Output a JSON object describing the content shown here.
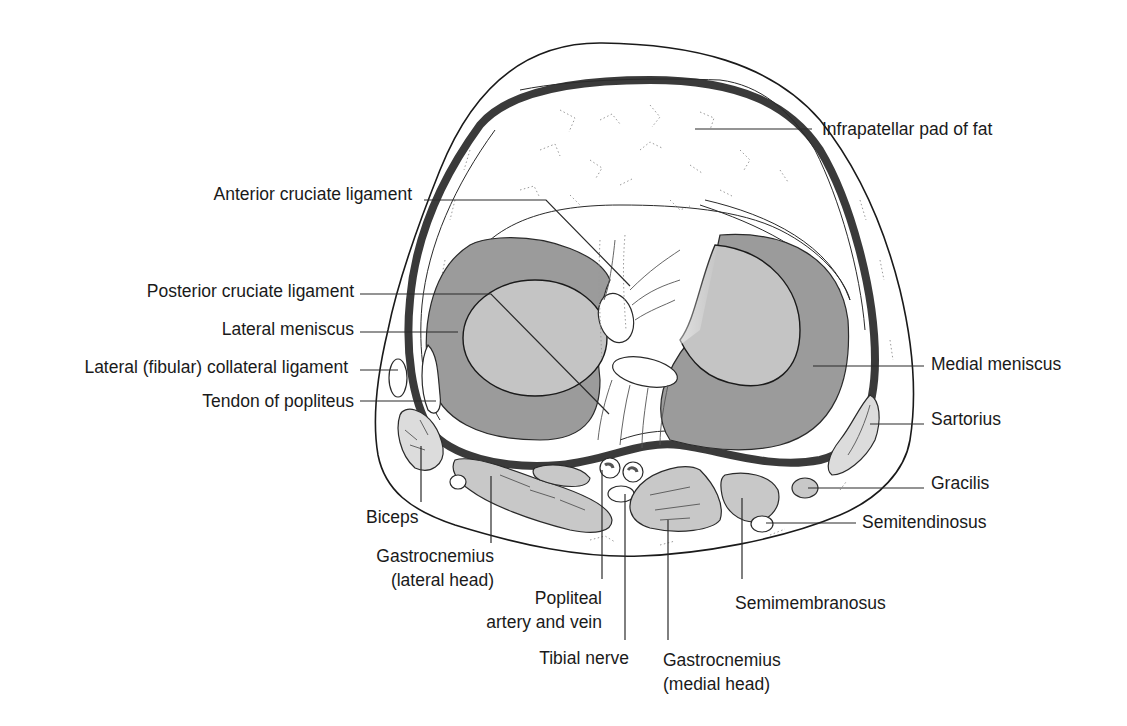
{
  "figure": {
    "background": "#ffffff",
    "colors": {
      "outline": "#1a1a1a",
      "capsule": "#3a3a3a",
      "meniscus_fill": "#9b9b9b",
      "condyle_fill": "#c4c4c4",
      "muscle_fill": "#c8c8c8"
    }
  },
  "labels": {
    "infrapatellar_fat": "Infrapatellar pad of fat",
    "acl": "Anterior cruciate ligament",
    "pcl": "Posterior cruciate ligament",
    "lateral_meniscus": "Lateral meniscus",
    "lcl": "Lateral (fibular) collateral ligament",
    "popliteus_tendon": "Tendon of popliteus",
    "medial_meniscus": "Medial meniscus",
    "sartorius": "Sartorius",
    "gracilis": "Gracilis",
    "semitendinosus": "Semitendinosus",
    "biceps": "Biceps",
    "gastrocnemius_lateral_1": "Gastrocnemius",
    "gastrocnemius_lateral_2": "(lateral head)",
    "popliteal_1": "Popliteal",
    "popliteal_2": "artery and vein",
    "tibial_nerve": "Tibial nerve",
    "gastrocnemius_medial_1": "Gastrocnemius",
    "gastrocnemius_medial_2": "(medial head)",
    "semimembranosus": "Semimembranosus"
  }
}
